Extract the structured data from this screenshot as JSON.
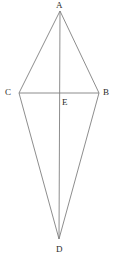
{
  "figure": {
    "type": "geometry-diagram",
    "shape_name": "kite ACDB with diagonals",
    "width": 115,
    "height": 263,
    "background_color": "#ffffff",
    "line_color": "#808080",
    "line_width": 0.9,
    "label_color": "#2b2b2b",
    "label_font_size": 9
  },
  "points": {
    "A": {
      "label": "A",
      "x": 60,
      "y": 11,
      "label_x": 56,
      "label_y": 1
    },
    "B": {
      "label": "B",
      "x": 99,
      "y": 93,
      "label_x": 103,
      "label_y": 88
    },
    "C": {
      "label": "C",
      "x": 19,
      "y": 93,
      "label_x": 5,
      "label_y": 88
    },
    "D": {
      "label": "D",
      "x": 59,
      "y": 239,
      "label_x": 56,
      "label_y": 245
    },
    "E": {
      "label": "E",
      "x": 59,
      "y": 93,
      "label_x": 62,
      "label_y": 98
    }
  },
  "segments": [
    {
      "name": "segment-AC",
      "from": "A",
      "to": "C",
      "x1": 60,
      "y1": 11,
      "x2": 19,
      "y2": 93
    },
    {
      "name": "segment-AB",
      "from": "A",
      "to": "B",
      "x1": 60,
      "y1": 11,
      "x2": 99,
      "y2": 93
    },
    {
      "name": "segment-CD",
      "from": "C",
      "to": "D",
      "x1": 19,
      "y1": 93,
      "x2": 59,
      "y2": 239
    },
    {
      "name": "segment-BD",
      "from": "B",
      "to": "D",
      "x1": 99,
      "y1": 93,
      "x2": 59,
      "y2": 239
    },
    {
      "name": "diagonal-CB",
      "from": "C",
      "to": "B",
      "x1": 19,
      "y1": 93,
      "x2": 99,
      "y2": 93
    },
    {
      "name": "diagonal-AD",
      "from": "A",
      "to": "D",
      "x1": 60,
      "y1": 11,
      "x2": 59,
      "y2": 239
    }
  ]
}
